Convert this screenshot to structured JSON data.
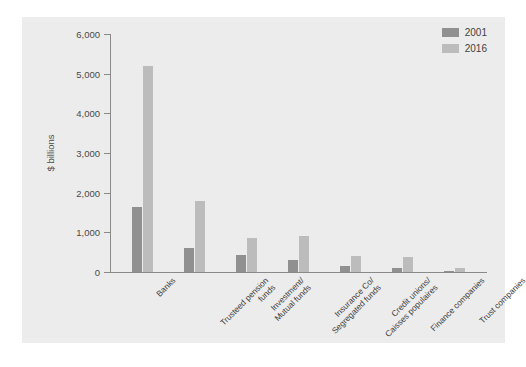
{
  "chart_data": {
    "type": "bar",
    "title": "",
    "xlabel": "",
    "ylabel": "$ billions",
    "ylim": [
      0,
      6000
    ],
    "yticks": [
      0,
      1000,
      2000,
      3000,
      4000,
      5000,
      6000
    ],
    "ytick_labels": [
      "0",
      "1,000",
      "2,000",
      "3,000",
      "4,000",
      "5,000",
      "6,000"
    ],
    "grid": false,
    "legend_position": "top-right",
    "categories": [
      "Banks",
      "Trusteed pension\nfunds",
      "Investment/\nMutual funds",
      "Insurance Co/\nSegregated funds",
      "Credit unions/\nCaisses populaires",
      "Finance companies",
      "Trust companies"
    ],
    "series": [
      {
        "name": "2001",
        "color": "#909090",
        "values": [
          1650,
          600,
          430,
          300,
          140,
          110,
          30
        ]
      },
      {
        "name": "2016",
        "color": "#bcbcbc",
        "values": [
          5200,
          1780,
          850,
          900,
          400,
          370,
          90
        ]
      }
    ]
  },
  "legend": {
    "items": [
      {
        "label": "2001",
        "color": "#909090"
      },
      {
        "label": "2016",
        "color": "#bcbcbc"
      }
    ]
  },
  "caption": {
    "text": ""
  }
}
